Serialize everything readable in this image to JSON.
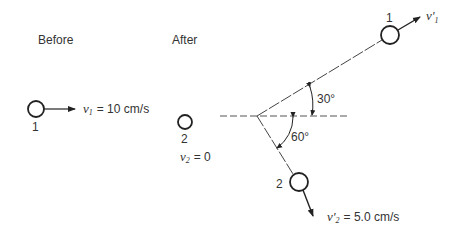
{
  "diagram": {
    "type": "elastic-collision",
    "labels": {
      "before": "Before",
      "after": "After"
    },
    "before": {
      "ball1": {
        "id": "1",
        "velocity_symbol": "v",
        "velocity_sub": "1",
        "velocity_value": "= 10 cm/s"
      }
    },
    "after": {
      "ball2_initial": {
        "id": "2",
        "velocity_symbol": "v",
        "velocity_sub": "2",
        "velocity_value": "= 0"
      },
      "ball1_final": {
        "id": "1",
        "velocity_symbol": "v'",
        "velocity_sub": "1"
      },
      "ball2_final": {
        "id": "2",
        "velocity_symbol": "v'",
        "velocity_sub": "2",
        "velocity_value": "= 5.0 cm/s"
      },
      "angles": {
        "ball1_angle": "30°",
        "ball2_angle": "60°"
      }
    },
    "colors": {
      "stroke": "#222222",
      "dash": "#555555",
      "text": "#333333"
    }
  }
}
